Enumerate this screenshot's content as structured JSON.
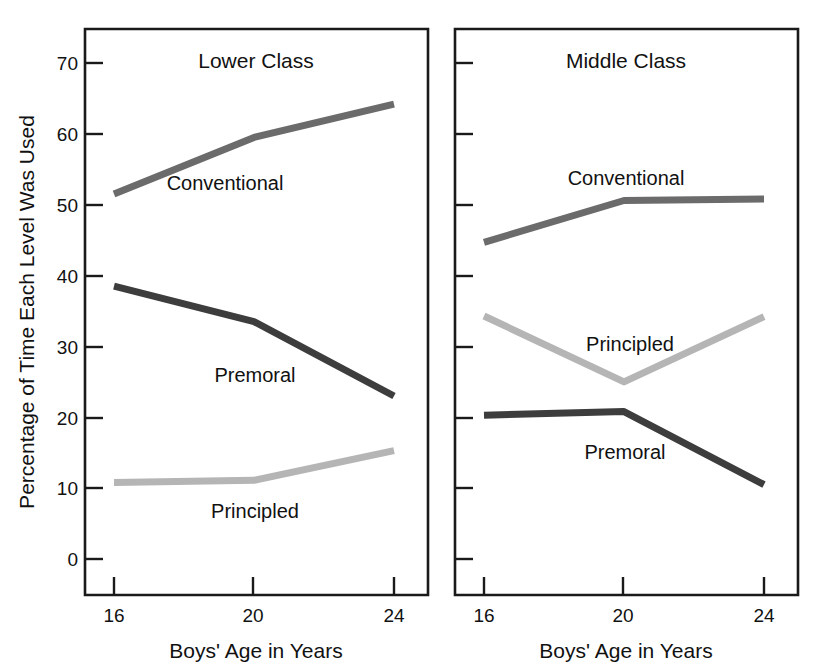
{
  "figure": {
    "background_color": "#ffffff",
    "width": 826,
    "height": 669
  },
  "shared": {
    "ylabel": "Percentage of Time Each Level Was Used",
    "xlabel": "Boys' Age in Years",
    "x_tick_labels": [
      "16",
      "20",
      "24"
    ],
    "y_tick_labels": [
      "0",
      "10",
      "20",
      "30",
      "40",
      "50",
      "60",
      "70"
    ]
  },
  "series_colors": {
    "Conventional": "#6b6b6b",
    "Premoral": "#3d3d3d",
    "Principled": "#b5b5b5"
  },
  "panels": {
    "left": {
      "title": "Lower Class",
      "labels": {
        "conventional": "Conventional",
        "premoral": "Premoral",
        "principled": "Principled"
      },
      "xlabel": "Boys' Age in Years",
      "ylabel": "Percentage of Time Each Level Was Used"
    },
    "right": {
      "title": "Middle Class",
      "labels": {
        "conventional": "Conventional",
        "premoral": "Premoral",
        "principled": "Principled"
      },
      "xlabel": "Boys' Age in Years"
    }
  },
  "chart_data": [
    {
      "type": "line",
      "title": "Lower Class",
      "xlabel": "Boys' Age in Years",
      "ylabel": "Percentage of Time Each Level Was Used",
      "x": [
        16,
        20,
        24
      ],
      "xlim": [
        14.3,
        25.5
      ],
      "ylim": [
        -8,
        75
      ],
      "yticks": [
        0,
        10,
        20,
        30,
        40,
        50,
        60,
        70
      ],
      "xticks": [
        16,
        20,
        24
      ],
      "grid": false,
      "legend": "inline-annotations",
      "series": [
        {
          "name": "Conventional",
          "color": "#6b6b6b",
          "values": [
            51.5,
            59.5,
            64.2
          ]
        },
        {
          "name": "Premoral",
          "color": "#3d3d3d",
          "values": [
            38.5,
            33.5,
            23.0
          ]
        },
        {
          "name": "Principled",
          "color": "#b5b5b5",
          "values": [
            10.8,
            11.1,
            15.3
          ]
        }
      ]
    },
    {
      "type": "line",
      "title": "Middle Class",
      "xlabel": "Boys' Age in Years",
      "ylabel": "",
      "x": [
        16,
        20,
        24
      ],
      "xlim": [
        14.3,
        25.5
      ],
      "ylim": [
        -8,
        75
      ],
      "yticks": [
        0,
        10,
        20,
        30,
        40,
        50,
        60,
        70
      ],
      "xticks": [
        16,
        20,
        24
      ],
      "grid": false,
      "legend": "inline-annotations",
      "series": [
        {
          "name": "Conventional",
          "color": "#6b6b6b",
          "values": [
            44.7,
            50.6,
            50.8
          ]
        },
        {
          "name": "Premoral",
          "color": "#3d3d3d",
          "values": [
            20.3,
            20.8,
            10.5
          ]
        },
        {
          "name": "Principled",
          "color": "#b5b5b5",
          "values": [
            34.3,
            25.0,
            34.2
          ]
        }
      ]
    }
  ]
}
